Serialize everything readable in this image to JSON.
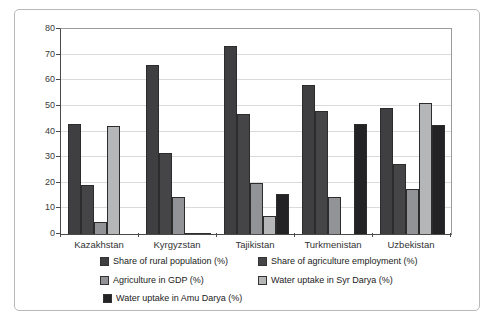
{
  "chart_data": {
    "type": "bar",
    "title": "",
    "xlabel": "",
    "ylabel": "",
    "categories": [
      "Kazakhstan",
      "Kyrgyzstan",
      "Tajikistan",
      "Turkmenistan",
      "Uzbekistan"
    ],
    "series": [
      {
        "name": "Share of rural population (%)",
        "color": "#3f3f42",
        "values": [
          43,
          66,
          73.5,
          58,
          49
        ]
      },
      {
        "name": "Share of agriculture employment (%)",
        "color": "#454548",
        "values": [
          19,
          31.5,
          47,
          48,
          27.5
        ]
      },
      {
        "name": "Agriculture in GDP (%)",
        "color": "#929396",
        "values": [
          4.5,
          14.5,
          20,
          14.5,
          17.5
        ]
      },
      {
        "name": "Water uptake in Syr Darya (%)",
        "color": "#b5b6b8",
        "values": [
          42,
          0.5,
          7,
          0,
          51
        ]
      },
      {
        "name": "Water uptake in Amu Darya (%)",
        "color": "#232326",
        "values": [
          0,
          0.3,
          15.5,
          43,
          42.5
        ]
      }
    ],
    "ylim": [
      0,
      80
    ],
    "yticks": [
      0,
      10,
      20,
      30,
      40,
      50,
      60,
      70,
      80
    ],
    "grid": true,
    "legend_position": "bottom"
  },
  "legend": {
    "positions": [
      {
        "x": 100,
        "y": 256
      },
      {
        "x": 258,
        "y": 256
      },
      {
        "x": 100,
        "y": 275
      },
      {
        "x": 258,
        "y": 275
      },
      {
        "x": 103,
        "y": 293
      }
    ]
  }
}
